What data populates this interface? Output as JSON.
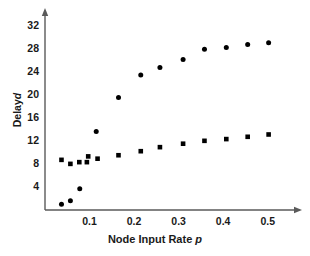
{
  "chart_data": {
    "type": "scatter",
    "title": "",
    "xlabel": "Node Input Rate p",
    "xlabel_main": "Node Input Rate",
    "xlabel_symbol": "p",
    "ylabel": "Delay d",
    "ylabel_main": "Delay",
    "ylabel_symbol": "d",
    "xlim": [
      0.0,
      0.55
    ],
    "ylim": [
      0.0,
      34.0
    ],
    "xticks": [
      0.1,
      0.2,
      0.3,
      0.4,
      0.5
    ],
    "xtick_labels": [
      "0.1",
      "0.2",
      "0.3",
      "0.4",
      "0.5"
    ],
    "yticks": [
      4,
      8,
      12,
      16,
      20,
      24,
      28,
      32
    ],
    "ytick_labels": [
      "4",
      "8",
      "12",
      "16",
      "20",
      "24",
      "28",
      "32"
    ],
    "grid": false,
    "legend": "none",
    "series": [
      {
        "name": "upper-series",
        "marker": "circle",
        "color": "#000000",
        "points": [
          {
            "x": 0.115,
            "y": 13.6
          },
          {
            "x": 0.165,
            "y": 19.5
          },
          {
            "x": 0.215,
            "y": 23.4
          },
          {
            "x": 0.258,
            "y": 24.7
          },
          {
            "x": 0.31,
            "y": 26.1
          },
          {
            "x": 0.358,
            "y": 27.9
          },
          {
            "x": 0.407,
            "y": 28.2
          },
          {
            "x": 0.455,
            "y": 28.7
          },
          {
            "x": 0.502,
            "y": 29.0
          }
        ]
      },
      {
        "name": "lower-series",
        "marker": "square",
        "color": "#000000",
        "points": [
          {
            "x": 0.037,
            "y": 8.7
          },
          {
            "x": 0.057,
            "y": 8.0
          },
          {
            "x": 0.077,
            "y": 8.3
          },
          {
            "x": 0.094,
            "y": 8.3
          },
          {
            "x": 0.097,
            "y": 9.3
          },
          {
            "x": 0.118,
            "y": 8.9
          },
          {
            "x": 0.165,
            "y": 9.5
          },
          {
            "x": 0.215,
            "y": 10.2
          },
          {
            "x": 0.258,
            "y": 10.9
          },
          {
            "x": 0.31,
            "y": 11.5
          },
          {
            "x": 0.358,
            "y": 12.0
          },
          {
            "x": 0.407,
            "y": 12.3
          },
          {
            "x": 0.455,
            "y": 12.7
          },
          {
            "x": 0.502,
            "y": 13.1
          }
        ]
      },
      {
        "name": "origin-series",
        "marker": "circle",
        "color": "#000000",
        "points": [
          {
            "x": 0.037,
            "y": 1.0
          },
          {
            "x": 0.057,
            "y": 1.6
          },
          {
            "x": 0.078,
            "y": 3.7
          }
        ]
      }
    ]
  },
  "axes": {
    "x_arrow": true,
    "y_arrow": true,
    "axis_color": "#555555"
  }
}
